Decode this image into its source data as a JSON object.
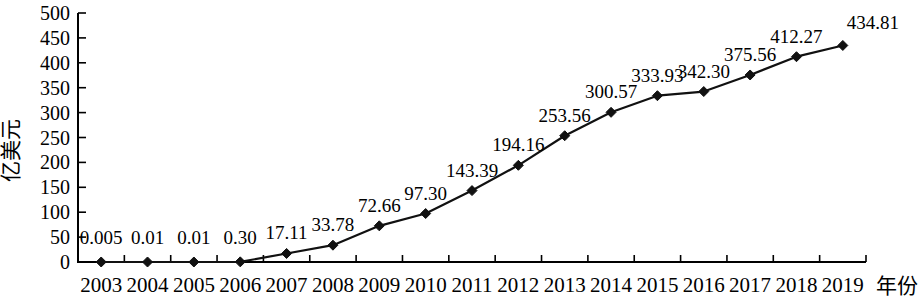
{
  "chart_data": {
    "type": "line",
    "title": "",
    "xlabel": "年份",
    "ylabel": "亿美元",
    "categories": [
      "2003",
      "2004",
      "2005",
      "2006",
      "2007",
      "2008",
      "2009",
      "2010",
      "2011",
      "2012",
      "2013",
      "2014",
      "2015",
      "2016",
      "2017",
      "2018",
      "2019"
    ],
    "values": [
      0.005,
      0.01,
      0.01,
      0.3,
      17.11,
      33.78,
      72.66,
      97.3,
      143.39,
      194.16,
      253.56,
      300.57,
      333.93,
      342.3,
      375.56,
      412.27,
      434.81
    ],
    "value_labels": [
      "0.005",
      "0.01",
      "0.01",
      "0.30",
      "17.11",
      "33.78",
      "72.66",
      "97.30",
      "143.39",
      "194.16",
      "253.56",
      "300.57",
      "333.93",
      "342.30",
      "375.56",
      "412.27",
      "434.81"
    ],
    "ylim": [
      0,
      500
    ],
    "ytick_values": [
      0,
      50,
      100,
      150,
      200,
      250,
      300,
      350,
      400,
      450,
      500
    ],
    "ytick_labels": [
      "0",
      "50",
      "100",
      "150",
      "200",
      "250",
      "300",
      "350",
      "400",
      "450",
      "500"
    ],
    "grid": false,
    "legend": null,
    "series_color": "#111111",
    "axis_color": "#000000",
    "marker": "diamond"
  },
  "axes": {
    "y_axis_title": "亿美元",
    "x_axis_title": "年份"
  }
}
